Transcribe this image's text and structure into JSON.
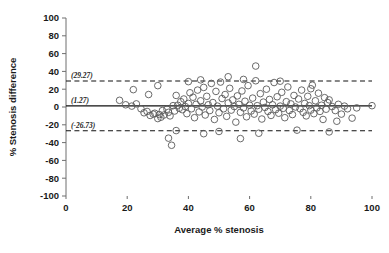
{
  "chart_data": {
    "type": "scatter",
    "title": "",
    "xlabel": "Average % stenosis",
    "ylabel": "% Stenosis difference",
    "xlim": [
      0,
      100
    ],
    "ylim": [
      -100,
      100
    ],
    "xticks": [
      0,
      20,
      40,
      60,
      80,
      100
    ],
    "yticks": [
      -100,
      -80,
      -60,
      -40,
      -20,
      0,
      20,
      40,
      60,
      80,
      100
    ],
    "grid": false,
    "legend": null,
    "reference_lines": [
      {
        "name": "upper-limit-of-agreement",
        "value": 29.27,
        "label": "(29.27)",
        "style": "dashed"
      },
      {
        "name": "mean-difference",
        "value": 1.27,
        "label": "(1.27)",
        "style": "solid"
      },
      {
        "name": "lower-limit-of-agreement",
        "value": -26.73,
        "label": "(-26.73)",
        "style": "dashed"
      }
    ],
    "marker": {
      "shape": "circle-open",
      "size": 3.3,
      "color": "#5a5a5a"
    },
    "points": [
      [
        17.5,
        7.5
      ],
      [
        19.5,
        2.5
      ],
      [
        21.5,
        1.0
      ],
      [
        23.0,
        3.5
      ],
      [
        24.5,
        -2.0
      ],
      [
        25.5,
        -6.5
      ],
      [
        26.5,
        -5.0
      ],
      [
        27.5,
        -9.5
      ],
      [
        28.5,
        -8.0
      ],
      [
        29.0,
        -7.0
      ],
      [
        30.0,
        -13.0
      ],
      [
        30.5,
        -8.5
      ],
      [
        31.0,
        -11.5
      ],
      [
        31.5,
        -4.0
      ],
      [
        32.0,
        -9.0
      ],
      [
        33.0,
        -2.5
      ],
      [
        33.5,
        -6.0
      ],
      [
        34.0,
        -10.0
      ],
      [
        34.5,
        -43.0
      ],
      [
        35.0,
        1.5
      ],
      [
        35.5,
        -4.5
      ],
      [
        36.0,
        13.0
      ],
      [
        36.5,
        2.0
      ],
      [
        37.0,
        -1.5
      ],
      [
        37.5,
        6.0
      ],
      [
        38.0,
        -3.0
      ],
      [
        38.5,
        9.0
      ],
      [
        39.0,
        0.5
      ],
      [
        39.5,
        -7.5
      ],
      [
        40.0,
        4.0
      ],
      [
        40.5,
        16.0
      ],
      [
        41.0,
        -2.0
      ],
      [
        41.5,
        11.0
      ],
      [
        42.0,
        -12.0
      ],
      [
        42.5,
        3.0
      ],
      [
        43.0,
        19.0
      ],
      [
        43.5,
        -5.5
      ],
      [
        44.0,
        7.0
      ],
      [
        44.5,
        0.0
      ],
      [
        45.0,
        22.0
      ],
      [
        45.5,
        -9.0
      ],
      [
        46.0,
        12.0
      ],
      [
        46.5,
        2.5
      ],
      [
        47.0,
        -4.0
      ],
      [
        47.5,
        26.5
      ],
      [
        48.0,
        5.0
      ],
      [
        48.5,
        -14.0
      ],
      [
        49.0,
        17.5
      ],
      [
        49.5,
        1.0
      ],
      [
        50.0,
        -6.5
      ],
      [
        50.5,
        28.0
      ],
      [
        51.0,
        9.5
      ],
      [
        51.5,
        -2.0
      ],
      [
        52.0,
        14.0
      ],
      [
        52.5,
        -10.5
      ],
      [
        53.0,
        4.5
      ],
      [
        53.5,
        21.0
      ],
      [
        54.0,
        -3.5
      ],
      [
        54.5,
        8.0
      ],
      [
        55.0,
        0.5
      ],
      [
        55.5,
        -17.0
      ],
      [
        56.0,
        12.5
      ],
      [
        56.5,
        3.0
      ],
      [
        57.0,
        -6.0
      ],
      [
        57.5,
        18.0
      ],
      [
        58.0,
        -1.0
      ],
      [
        58.5,
        6.5
      ],
      [
        59.0,
        -11.0
      ],
      [
        59.5,
        24.0
      ],
      [
        60.0,
        2.0
      ],
      [
        60.5,
        -4.5
      ],
      [
        61.0,
        10.0
      ],
      [
        61.5,
        -8.0
      ],
      [
        62.0,
        46.0
      ],
      [
        62.5,
        1.5
      ],
      [
        63.0,
        -2.5
      ],
      [
        63.5,
        15.0
      ],
      [
        64.0,
        -13.5
      ],
      [
        64.5,
        5.5
      ],
      [
        65.0,
        -0.5
      ],
      [
        65.5,
        20.0
      ],
      [
        66.0,
        -5.0
      ],
      [
        66.5,
        8.5
      ],
      [
        67.0,
        -9.5
      ],
      [
        67.5,
        2.5
      ],
      [
        68.0,
        27.5
      ],
      [
        68.5,
        -3.0
      ],
      [
        69.0,
        11.5
      ],
      [
        69.5,
        -7.0
      ],
      [
        70.0,
        1.0
      ],
      [
        70.5,
        16.5
      ],
      [
        71.0,
        -1.5
      ],
      [
        71.5,
        -12.0
      ],
      [
        72.0,
        6.0
      ],
      [
        72.5,
        22.5
      ],
      [
        73.0,
        -4.0
      ],
      [
        73.5,
        3.5
      ],
      [
        74.0,
        -8.5
      ],
      [
        74.5,
        13.0
      ],
      [
        75.0,
        0.0
      ],
      [
        75.5,
        -26.0
      ],
      [
        76.0,
        9.0
      ],
      [
        76.5,
        -2.0
      ],
      [
        77.0,
        19.0
      ],
      [
        77.5,
        -6.0
      ],
      [
        78.0,
        4.0
      ],
      [
        78.5,
        -10.0
      ],
      [
        79.0,
        12.0
      ],
      [
        79.5,
        1.5
      ],
      [
        80.0,
        -3.5
      ],
      [
        80.5,
        24.5
      ],
      [
        81.0,
        -7.5
      ],
      [
        81.5,
        7.0
      ],
      [
        82.0,
        -1.0
      ],
      [
        82.5,
        15.5
      ],
      [
        83.0,
        -5.0
      ],
      [
        83.5,
        2.0
      ],
      [
        84.0,
        -14.0
      ],
      [
        84.5,
        10.5
      ],
      [
        85.0,
        -2.5
      ],
      [
        85.5,
        5.0
      ],
      [
        86.0,
        -28.0
      ],
      [
        87.0,
        0.5
      ],
      [
        88.0,
        -4.0
      ],
      [
        89.0,
        3.0
      ],
      [
        90.0,
        -8.0
      ],
      [
        91.0,
        1.0
      ],
      [
        92.0,
        -2.0
      ],
      [
        93.5,
        -12.5
      ],
      [
        100.0,
        1.5
      ],
      [
        33.5,
        -35.0
      ],
      [
        57.0,
        -35.5
      ],
      [
        45.0,
        -30.0
      ],
      [
        63.0,
        -29.5
      ],
      [
        27.0,
        14.0
      ],
      [
        22.0,
        19.5
      ],
      [
        30.0,
        24.0
      ],
      [
        58.0,
        31.0
      ],
      [
        62.0,
        29.5
      ],
      [
        44.0,
        30.5
      ],
      [
        53.0,
        34.0
      ],
      [
        40.0,
        28.5
      ],
      [
        70.0,
        29.0
      ],
      [
        80.0,
        20.5
      ],
      [
        86.0,
        8.0
      ],
      [
        88.5,
        -16.0
      ],
      [
        95.0,
        -1.0
      ],
      [
        36.0,
        -26.5
      ],
      [
        50.0,
        -27.5
      ]
    ]
  }
}
